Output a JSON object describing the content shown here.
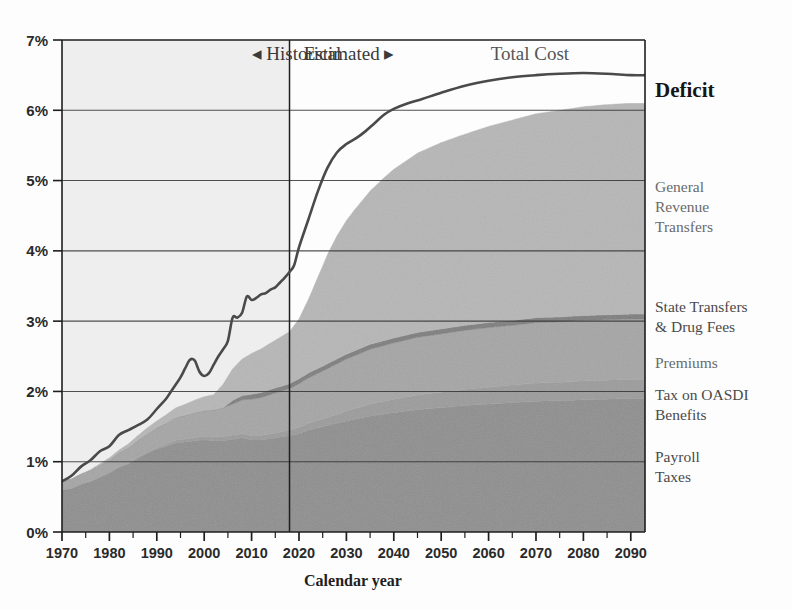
{
  "chart_data": {
    "type": "area",
    "title": "",
    "xlabel": "Calendar year",
    "ylabel": "",
    "xlim": [
      1970,
      2093
    ],
    "ylim": [
      0,
      7
    ],
    "grid": true,
    "legend_position": "right",
    "y_tick_labels": [
      "0%",
      "1%",
      "2%",
      "3%",
      "4%",
      "5%",
      "6%",
      "7%"
    ],
    "y_tick_values": [
      0,
      1,
      2,
      3,
      4,
      5,
      6,
      7
    ],
    "x_tick_labels": [
      "1970",
      "1980",
      "1990",
      "2000",
      "2010",
      "2020",
      "2030",
      "2040",
      "2050",
      "2060",
      "2070",
      "2080",
      "2090"
    ],
    "x_tick_values": [
      1970,
      1980,
      1990,
      2000,
      2010,
      2020,
      2030,
      2040,
      2050,
      2060,
      2070,
      2080,
      2090
    ],
    "x_minor_step": 5,
    "divider_year": 2018,
    "annotations": [
      {
        "name": "historical",
        "text": "◂ Historical",
        "x": 2010,
        "y": 6.72
      },
      {
        "name": "estimated",
        "text": "Estimated ▸",
        "x": 2021,
        "y": 6.72
      },
      {
        "name": "total-cost",
        "text": "Total Cost",
        "x": 2077,
        "y": 6.72
      }
    ],
    "series": [
      {
        "name": "Payroll Taxes",
        "label": "Payroll\nTaxes",
        "color": "#8e8e8e",
        "x": [
          1970,
          1972,
          1974,
          1976,
          1978,
          1980,
          1982,
          1984,
          1986,
          1988,
          1990,
          1992,
          1994,
          1996,
          1998,
          2000,
          2002,
          2004,
          2006,
          2008,
          2010,
          2012,
          2014,
          2016,
          2018,
          2020,
          2022,
          2025,
          2030,
          2035,
          2040,
          2045,
          2050,
          2055,
          2060,
          2065,
          2070,
          2075,
          2080,
          2085,
          2090,
          2093
        ],
        "values": [
          0.6,
          0.62,
          0.68,
          0.72,
          0.78,
          0.84,
          0.92,
          0.97,
          1.05,
          1.12,
          1.18,
          1.22,
          1.27,
          1.28,
          1.3,
          1.31,
          1.3,
          1.3,
          1.32,
          1.34,
          1.31,
          1.31,
          1.33,
          1.35,
          1.37,
          1.4,
          1.45,
          1.5,
          1.58,
          1.65,
          1.7,
          1.74,
          1.77,
          1.8,
          1.82,
          1.84,
          1.86,
          1.87,
          1.88,
          1.89,
          1.9,
          1.9
        ]
      },
      {
        "name": "Tax on OASDI Benefits",
        "label": "Tax on OASDI\nBenefits",
        "color": "#9b9b9b",
        "x": [
          1970,
          1980,
          1990,
          1995,
          2000,
          2005,
          2010,
          2015,
          2018,
          2020,
          2025,
          2030,
          2035,
          2040,
          2045,
          2050,
          2055,
          2060,
          2065,
          2070,
          2075,
          2080,
          2085,
          2090,
          2093
        ],
        "values": [
          0.0,
          0.0,
          0.02,
          0.04,
          0.05,
          0.06,
          0.06,
          0.07,
          0.08,
          0.09,
          0.11,
          0.14,
          0.17,
          0.19,
          0.21,
          0.22,
          0.23,
          0.24,
          0.25,
          0.26,
          0.26,
          0.27,
          0.27,
          0.27,
          0.27
        ]
      },
      {
        "name": "Premiums",
        "label": "Premiums",
        "color": "#a5a5a5",
        "x": [
          1970,
          1974,
          1978,
          1982,
          1986,
          1990,
          1994,
          1998,
          2002,
          2006,
          2010,
          2014,
          2018,
          2020,
          2025,
          2030,
          2035,
          2040,
          2045,
          2050,
          2055,
          2060,
          2065,
          2070,
          2075,
          2080,
          2085,
          2090,
          2093
        ],
        "values": [
          0.12,
          0.14,
          0.17,
          0.2,
          0.24,
          0.28,
          0.32,
          0.35,
          0.38,
          0.44,
          0.52,
          0.56,
          0.59,
          0.62,
          0.68,
          0.74,
          0.78,
          0.8,
          0.82,
          0.83,
          0.84,
          0.85,
          0.85,
          0.86,
          0.86,
          0.86,
          0.86,
          0.86,
          0.86
        ]
      },
      {
        "name": "State Transfers & Drug Fees",
        "label": "State Transfers\n& Drug Fees",
        "color": "#7d7d7d",
        "x": [
          1970,
          2004,
          2006,
          2010,
          2014,
          2018,
          2022,
          2026,
          2030,
          2035,
          2040,
          2045,
          2050,
          2055,
          2060,
          2065,
          2070,
          2075,
          2080,
          2085,
          2090,
          2093
        ],
        "values": [
          0.0,
          0.0,
          0.05,
          0.07,
          0.07,
          0.07,
          0.07,
          0.07,
          0.07,
          0.07,
          0.07,
          0.07,
          0.07,
          0.07,
          0.07,
          0.07,
          0.07,
          0.07,
          0.07,
          0.07,
          0.07,
          0.07
        ]
      },
      {
        "name": "General Revenue Transfers",
        "label": "General\nRevenue\nTransfers",
        "color": "#b6b6b6",
        "x": [
          1970,
          1974,
          1978,
          1982,
          1986,
          1990,
          1994,
          1998,
          2002,
          2006,
          2008,
          2010,
          2012,
          2014,
          2016,
          2018,
          2020,
          2022,
          2024,
          2026,
          2028,
          2030,
          2032,
          2035,
          2038,
          2040,
          2045,
          2050,
          2055,
          2060,
          2065,
          2070,
          2075,
          2080,
          2085,
          2090,
          2093
        ],
        "values": [
          0.0,
          0.0,
          0.02,
          0.04,
          0.07,
          0.1,
          0.14,
          0.18,
          0.22,
          0.45,
          0.52,
          0.58,
          0.62,
          0.66,
          0.7,
          0.74,
          0.85,
          1.05,
          1.3,
          1.55,
          1.75,
          1.9,
          2.02,
          2.18,
          2.32,
          2.4,
          2.55,
          2.65,
          2.72,
          2.79,
          2.85,
          2.9,
          2.94,
          2.97,
          2.99,
          3.0,
          3.0
        ]
      }
    ],
    "total_cost_line": {
      "name": "Total Cost",
      "color": "#4a4a4a",
      "x": [
        1970,
        1972,
        1974,
        1976,
        1978,
        1980,
        1982,
        1984,
        1986,
        1988,
        1990,
        1992,
        1993,
        1994,
        1995,
        1996,
        1997,
        1998,
        1999,
        2000,
        2001,
        2002,
        2003,
        2004,
        2005,
        2006,
        2007,
        2008,
        2009,
        2010,
        2011,
        2012,
        2013,
        2014,
        2015,
        2016,
        2017,
        2018,
        2019,
        2020,
        2022,
        2024,
        2026,
        2028,
        2030,
        2032,
        2034,
        2036,
        2038,
        2040,
        2043,
        2046,
        2050,
        2055,
        2060,
        2065,
        2070,
        2075,
        2080,
        2085,
        2090,
        2093
      ],
      "values": [
        0.72,
        0.8,
        0.93,
        1.02,
        1.15,
        1.22,
        1.38,
        1.45,
        1.52,
        1.6,
        1.75,
        1.9,
        2.0,
        2.1,
        2.2,
        2.33,
        2.45,
        2.44,
        2.28,
        2.22,
        2.26,
        2.38,
        2.5,
        2.6,
        2.72,
        3.05,
        3.05,
        3.12,
        3.35,
        3.3,
        3.33,
        3.38,
        3.4,
        3.45,
        3.48,
        3.55,
        3.62,
        3.7,
        3.8,
        4.05,
        4.45,
        4.85,
        5.18,
        5.4,
        5.52,
        5.6,
        5.7,
        5.82,
        5.94,
        6.02,
        6.1,
        6.16,
        6.25,
        6.35,
        6.42,
        6.47,
        6.5,
        6.52,
        6.53,
        6.52,
        6.5,
        6.5
      ]
    },
    "legend_items": [
      {
        "name": "deficit",
        "label": "Deficit",
        "style": "deficit"
      },
      {
        "name": "general-revenue-transfers",
        "label": "General\nRevenue\nTransfers",
        "style": "light"
      },
      {
        "name": "state-transfers-drug-fees",
        "label": "State Transfers\n& Drug Fees",
        "style": "dark"
      },
      {
        "name": "premiums",
        "label": "Premiums",
        "style": "light"
      },
      {
        "name": "tax-on-oasdi-benefits",
        "label": "Tax on OASDI\nBenefits",
        "style": "dark"
      },
      {
        "name": "payroll-taxes",
        "label": "Payroll\nTaxes",
        "style": "dark"
      }
    ],
    "colors": {
      "historical_backdrop": "#eeeeee",
      "axis": "#1e1e1e",
      "grid": "#333333",
      "plot_background": "#ffffff"
    }
  }
}
